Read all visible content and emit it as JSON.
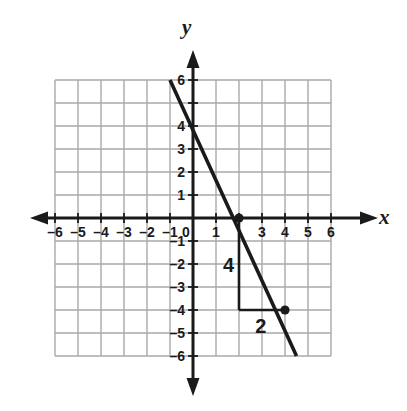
{
  "figure": {
    "axis_labels": {
      "x": "x",
      "y": "y"
    }
  },
  "chart_data": {
    "type": "line",
    "title": "",
    "xlabel": "x",
    "ylabel": "y",
    "xlim": [
      -6.8,
      6.8
    ],
    "ylim": [
      -6.8,
      6.8
    ],
    "grid": true,
    "grid_range": {
      "xmin": -6,
      "xmax": 6,
      "ymin": -6,
      "ymax": 6
    },
    "legend": "none",
    "x_ticks": [
      -6,
      -5,
      -4,
      -3,
      -2,
      -1,
      0,
      1,
      2,
      3,
      4,
      5,
      6
    ],
    "x_tick_labels": [
      "–6",
      "–5",
      "–4",
      "–3",
      "–2",
      "–1",
      "0",
      "1",
      "2",
      "3",
      "4",
      "5",
      "6"
    ],
    "x_tick_labels_hidden": [
      "2"
    ],
    "y_ticks": [
      -6,
      -5,
      -4,
      -3,
      -2,
      -1,
      1,
      2,
      3,
      4,
      5,
      6
    ],
    "y_tick_labels": [
      "–6",
      "–5",
      "–4",
      "–3",
      "–2",
      "–1",
      "1",
      "2",
      "3",
      "4",
      "5",
      "6"
    ],
    "y_tick_labels_hidden": [
      "5"
    ],
    "series": [
      {
        "name": "line",
        "equation": "y = -2x + 4",
        "slope": -2,
        "y_intercept": 4,
        "x_intercept": 2,
        "endpoints": [
          {
            "x": -1,
            "y": 6
          },
          {
            "x": 4.5,
            "y": -6
          }
        ]
      }
    ],
    "points": [
      {
        "x": 2,
        "y": 0
      },
      {
        "x": 4,
        "y": -4
      }
    ],
    "annotations": [
      {
        "name": "rise",
        "label": "4",
        "kind": "vertical-segment",
        "from": {
          "x": 2,
          "y": 0
        },
        "to": {
          "x": 2,
          "y": -4
        },
        "label_at": {
          "x": 1.55,
          "y": -2.1
        }
      },
      {
        "name": "run",
        "label": "2",
        "kind": "horizontal-segment",
        "from": {
          "x": 2,
          "y": -4
        },
        "to": {
          "x": 4,
          "y": -4
        },
        "label_at": {
          "x": 2.95,
          "y": -4.75
        }
      }
    ]
  },
  "colors": {
    "background": "#ffffff",
    "grid": "#a9a9a9",
    "axis": "#1a1a1a",
    "line": "#1a1a1a",
    "point": "#1a1a1a",
    "tick_label": "#1a1a1a"
  }
}
